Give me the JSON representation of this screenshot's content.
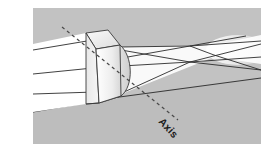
{
  "figure": {
    "domain": "optics-ray-diagram",
    "canvas": {
      "width": 276,
      "height": 154
    },
    "background": {
      "page_color": "#ffffff",
      "panel_color": "#c2c2c2",
      "panel_rect": {
        "x": 33,
        "y": 8,
        "width": 228,
        "height": 136
      }
    },
    "labels": {
      "axis": {
        "text": "Axis",
        "rotation_deg": 47,
        "x": 158,
        "y": 122,
        "color": "#1a1a1a"
      }
    },
    "colors": {
      "panel_gray": "#c2c2c2",
      "beam_white": "#ffffff",
      "ray_line": "#2b2b2b",
      "lens_face_light": "#f2f2f2",
      "lens_face_mid": "#e2e2e2",
      "lens_face_dark": "#d2d2d2",
      "lens_outline": "#3a3a3a",
      "dash_color": "#4a4a4a",
      "glow_white": "#ffffff"
    },
    "elements": {
      "incoming_beam_name": "collimated-input-beam",
      "lens_name": "cylindrical-lens",
      "output_beam_name": "converging-output-beam",
      "focus_name": "focal-line",
      "axis_name": "optical-axis-dashed-line"
    },
    "geometry": {
      "incoming_beam_polygon": "33,44 86,33 86,104 33,112",
      "incoming_rays": [
        "33,50 92,40",
        "33,74 92,68",
        "33,94 92,92"
      ],
      "lens_top_face": "86,33 108,30 120,45 96,49",
      "lens_front_face": "96,49 120,45 122,95 99,103",
      "lens_side_face": "86,33 96,49 99,103 86,104",
      "lens_bulge_path": "M120,45 C133,55 134,86 122,95 L99,103 L96,49 Z",
      "output_beam_polygon": "122,48 214,45 261,36 261,62 214,56 124,92",
      "output_rays": [
        "122,52 190,48 261,41",
        "122,66 190,62 261,57",
        "124,90 190,62 261,45",
        "122,50 190,62 261,69",
        "120,46 214,46"
      ],
      "glow_ellipse": {
        "cx": 238,
        "cy": 50,
        "rx": 30,
        "ry": 14
      },
      "ground_line": "33,112 112,98 261,78",
      "axis_dash_line": "62,28 175,118"
    }
  }
}
